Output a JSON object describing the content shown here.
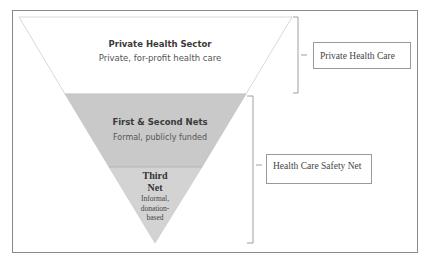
{
  "diagram": {
    "type": "inverted-pyramid",
    "tiers": [
      {
        "title": "Private Health Sector",
        "subtitle": "Private, for-profit health care",
        "fill": "#ffffff"
      },
      {
        "title": "First & Second Nets",
        "subtitle": "Formal, publicly funded",
        "fill": "#c9c9c9"
      },
      {
        "title": "Third Net",
        "subtitle": "Informal, donation-based",
        "title_lines": [
          "Third",
          "Net"
        ],
        "subtitle_lines": [
          "Informal,",
          "donation-",
          "based"
        ],
        "fill": "#d3d3d3"
      }
    ],
    "groups": [
      {
        "label": "Private Health Care",
        "covers": [
          "Private Health Sector"
        ]
      },
      {
        "label": "Health Care Safety Net",
        "covers": [
          "First & Second Nets",
          "Third Net"
        ]
      }
    ]
  }
}
